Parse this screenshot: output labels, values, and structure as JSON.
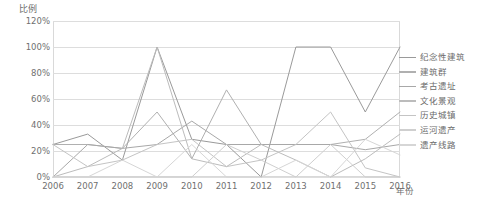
{
  "chart_data": {
    "type": "line",
    "title": "",
    "xlabel": "年份",
    "ylabel": "比例",
    "grid": true,
    "legend_position": "right",
    "x": [
      "2006",
      "2007",
      "2008",
      "2009",
      "2010",
      "2011",
      "2012",
      "2013",
      "2014",
      "2015",
      "2016"
    ],
    "ylim": [
      0,
      120
    ],
    "yticks": [
      "0%",
      "20%",
      "40%",
      "60%",
      "80%",
      "100%",
      "120%"
    ],
    "ytick_values": [
      0,
      20,
      40,
      60,
      80,
      100,
      120
    ],
    "series": [
      {
        "name": "纪念性建筑",
        "color": "#9a9a9a",
        "values": [
          25,
          33,
          13,
          100,
          29,
          25,
          0,
          100,
          100,
          50,
          100
        ]
      },
      {
        "name": "建筑群",
        "color": "#b0b0b0",
        "values": [
          25,
          25,
          22,
          50,
          14,
          67,
          25,
          25,
          25,
          29,
          50
        ]
      },
      {
        "name": "考古遗址",
        "color": "#a8a8a8",
        "values": [
          0,
          25,
          22,
          25,
          43,
          25,
          25,
          25,
          25,
          21,
          25
        ]
      },
      {
        "name": "文化景观",
        "color": "#bcbcbc",
        "values": [
          0,
          8,
          22,
          100,
          14,
          8,
          25,
          13,
          0,
          14,
          33
        ]
      },
      {
        "name": "历史城镇",
        "color": "#c4c4c4",
        "values": [
          25,
          8,
          13,
          25,
          29,
          8,
          13,
          25,
          50,
          7,
          0
        ]
      },
      {
        "name": "运河遗产",
        "color": "#cfcfcf",
        "values": [
          0,
          0,
          0,
          0,
          0,
          25,
          13,
          0,
          25,
          0,
          0
        ]
      },
      {
        "name": "遗产线路",
        "color": "#d6d6d6",
        "values": [
          0,
          0,
          13,
          0,
          25,
          0,
          0,
          13,
          0,
          29,
          17
        ]
      }
    ]
  },
  "axes": {
    "y_title": "比例",
    "x_title": "年份"
  },
  "legend": {
    "items": [
      {
        "label": "纪念性建筑"
      },
      {
        "label": "建筑群"
      },
      {
        "label": "考古遗址"
      },
      {
        "label": "文化景观"
      },
      {
        "label": "历史城镇"
      },
      {
        "label": "运河遗产"
      },
      {
        "label": "遗产线路"
      }
    ]
  }
}
